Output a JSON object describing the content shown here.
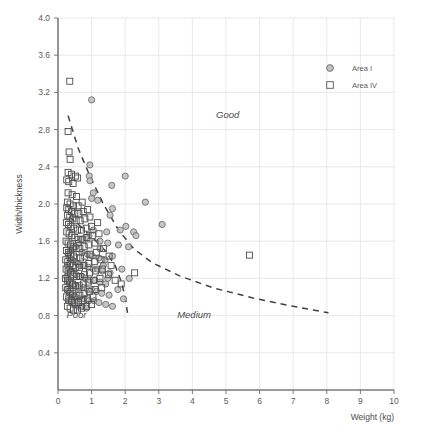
{
  "chart_data": {
    "type": "scatter",
    "title": "",
    "xlabel": "Weight (kg)",
    "ylabel": "Width/thickness",
    "xlim": [
      0,
      10
    ],
    "ylim": [
      0,
      4.0
    ],
    "xticks": [
      "0",
      "1",
      "2",
      "3",
      "4",
      "5",
      "6",
      "7",
      "8",
      "9",
      "10"
    ],
    "yticks": [
      "0.4",
      "0.8",
      "1.2",
      "1.6",
      "2.0",
      "2.4",
      "2.8",
      "3.2",
      "3.6",
      "4.0"
    ],
    "grid": true,
    "legend_position": "top-right",
    "legend": [
      {
        "name": "Area I",
        "marker": "circle",
        "fill": "#b8b8b8",
        "stroke": "#6b6b6b"
      },
      {
        "name": "Area IV",
        "marker": "square",
        "fill": "none",
        "stroke": "#555555"
      }
    ],
    "annotations": [
      {
        "text": "Good",
        "x": 5.05,
        "y": 2.93,
        "style": "italic"
      },
      {
        "text": "Medium",
        "x": 4.05,
        "y": 0.77,
        "style": "italic"
      },
      {
        "text": "Poor",
        "x": 0.55,
        "y": 0.77,
        "style": "italic"
      }
    ],
    "boundary_curves": [
      {
        "name": "good-medium-boundary",
        "style": "dashed",
        "points": [
          [
            0.3,
            2.95
          ],
          [
            0.6,
            2.6
          ],
          [
            0.95,
            2.3
          ],
          [
            1.35,
            2.0
          ],
          [
            1.8,
            1.72
          ],
          [
            2.25,
            1.52
          ],
          [
            2.8,
            1.37
          ],
          [
            3.6,
            1.23
          ],
          [
            4.6,
            1.1
          ],
          [
            5.8,
            0.99
          ],
          [
            7.0,
            0.9
          ],
          [
            8.05,
            0.83
          ]
        ]
      },
      {
        "name": "poor-medium-boundary",
        "style": "dashed",
        "points": [
          [
            0.35,
            1.86
          ],
          [
            0.7,
            1.75
          ],
          [
            1.05,
            1.63
          ],
          [
            1.4,
            1.5
          ],
          [
            1.7,
            1.34
          ],
          [
            1.9,
            1.15
          ],
          [
            2.02,
            0.95
          ],
          [
            2.08,
            0.8
          ]
        ]
      }
    ],
    "series": [
      {
        "name": "Area I",
        "marker": "circle",
        "points": [
          [
            1.0,
            3.12
          ],
          [
            0.95,
            2.42
          ],
          [
            0.93,
            2.3
          ],
          [
            0.95,
            2.25
          ],
          [
            2.0,
            2.3
          ],
          [
            1.6,
            2.2
          ],
          [
            1.05,
            2.12
          ],
          [
            1.0,
            2.06
          ],
          [
            1.18,
            2.04
          ],
          [
            2.6,
            2.02
          ],
          [
            1.62,
            1.95
          ],
          [
            1.55,
            1.88
          ],
          [
            3.1,
            1.78
          ],
          [
            2.02,
            1.76
          ],
          [
            1.85,
            1.72
          ],
          [
            2.25,
            1.7
          ],
          [
            1.45,
            1.7
          ],
          [
            2.32,
            1.66
          ],
          [
            1.05,
            1.72
          ],
          [
            0.92,
            1.66
          ],
          [
            0.82,
            1.64
          ],
          [
            0.7,
            1.62
          ],
          [
            1.25,
            1.6
          ],
          [
            1.48,
            1.58
          ],
          [
            1.8,
            1.56
          ],
          [
            2.1,
            1.54
          ],
          [
            0.6,
            1.58
          ],
          [
            0.52,
            1.54
          ],
          [
            0.45,
            1.52
          ],
          [
            0.38,
            1.5
          ],
          [
            0.72,
            1.48
          ],
          [
            0.88,
            1.46
          ],
          [
            1.02,
            1.44
          ],
          [
            1.22,
            1.42
          ],
          [
            1.4,
            1.4
          ],
          [
            1.62,
            1.44
          ],
          [
            0.3,
            1.46
          ],
          [
            0.35,
            1.42
          ],
          [
            0.42,
            1.4
          ],
          [
            0.5,
            1.38
          ],
          [
            0.58,
            1.36
          ],
          [
            0.65,
            1.34
          ],
          [
            0.78,
            1.34
          ],
          [
            0.9,
            1.32
          ],
          [
            1.05,
            1.3
          ],
          [
            1.18,
            1.3
          ],
          [
            1.32,
            1.28
          ],
          [
            1.55,
            1.26
          ],
          [
            0.28,
            1.34
          ],
          [
            0.33,
            1.3
          ],
          [
            0.4,
            1.28
          ],
          [
            0.48,
            1.26
          ],
          [
            0.55,
            1.24
          ],
          [
            0.62,
            1.22
          ],
          [
            0.72,
            1.22
          ],
          [
            0.82,
            1.2
          ],
          [
            0.95,
            1.18
          ],
          [
            1.1,
            1.18
          ],
          [
            1.25,
            1.16
          ],
          [
            1.42,
            1.14
          ],
          [
            0.26,
            1.22
          ],
          [
            0.31,
            1.18
          ],
          [
            0.38,
            1.16
          ],
          [
            0.45,
            1.14
          ],
          [
            0.53,
            1.12
          ],
          [
            0.62,
            1.1
          ],
          [
            0.75,
            1.1
          ],
          [
            0.88,
            1.08
          ],
          [
            1.0,
            1.08
          ],
          [
            1.15,
            1.06
          ],
          [
            1.3,
            1.04
          ],
          [
            1.52,
            1.02
          ],
          [
            0.27,
            1.08
          ],
          [
            0.34,
            1.04
          ],
          [
            0.42,
            1.02
          ],
          [
            0.52,
            1.0
          ],
          [
            0.64,
            0.98
          ],
          [
            0.78,
            0.98
          ],
          [
            0.92,
            0.96
          ],
          [
            1.08,
            0.96
          ],
          [
            1.22,
            0.94
          ],
          [
            1.78,
            1.08
          ],
          [
            1.42,
            0.92
          ],
          [
            1.62,
            0.9
          ],
          [
            0.3,
            0.96
          ],
          [
            0.4,
            0.94
          ],
          [
            0.5,
            0.92
          ],
          [
            0.6,
            0.9
          ],
          [
            0.72,
            0.9
          ],
          [
            0.85,
            0.88
          ],
          [
            1.25,
            1.52
          ],
          [
            1.35,
            1.34
          ],
          [
            1.48,
            1.2
          ],
          [
            1.9,
            1.3
          ],
          [
            2.12,
            1.2
          ],
          [
            1.95,
            0.98
          ]
        ]
      },
      {
        "name": "Area IV",
        "marker": "square",
        "points": [
          [
            0.35,
            3.32
          ],
          [
            0.3,
            2.78
          ],
          [
            0.33,
            2.56
          ],
          [
            0.36,
            2.48
          ],
          [
            0.3,
            2.34
          ],
          [
            0.4,
            2.32
          ],
          [
            0.52,
            2.3
          ],
          [
            0.26,
            2.26
          ],
          [
            0.32,
            2.24
          ],
          [
            0.45,
            2.22
          ],
          [
            0.58,
            2.28
          ],
          [
            0.3,
            2.12
          ],
          [
            0.42,
            2.1
          ],
          [
            0.55,
            2.08
          ],
          [
            0.28,
            2.02
          ],
          [
            0.36,
            2.0
          ],
          [
            0.46,
            1.98
          ],
          [
            0.6,
            1.98
          ],
          [
            0.72,
            2.02
          ],
          [
            0.26,
            1.96
          ],
          [
            0.32,
            1.94
          ],
          [
            0.4,
            1.92
          ],
          [
            0.5,
            1.9
          ],
          [
            0.62,
            1.9
          ],
          [
            0.75,
            1.92
          ],
          [
            0.88,
            1.94
          ],
          [
            0.28,
            1.88
          ],
          [
            0.35,
            1.86
          ],
          [
            0.44,
            1.84
          ],
          [
            0.54,
            1.82
          ],
          [
            0.66,
            1.82
          ],
          [
            0.8,
            1.84
          ],
          [
            0.95,
            1.86
          ],
          [
            0.25,
            1.8
          ],
          [
            0.31,
            1.78
          ],
          [
            0.38,
            1.76
          ],
          [
            0.47,
            1.74
          ],
          [
            0.58,
            1.72
          ],
          [
            0.7,
            1.72
          ],
          [
            0.84,
            1.74
          ],
          [
            1.0,
            1.76
          ],
          [
            1.18,
            1.8
          ],
          [
            0.26,
            1.7
          ],
          [
            0.33,
            1.68
          ],
          [
            0.41,
            1.66
          ],
          [
            0.5,
            1.64
          ],
          [
            0.6,
            1.62
          ],
          [
            0.72,
            1.62
          ],
          [
            0.86,
            1.64
          ],
          [
            1.02,
            1.66
          ],
          [
            1.22,
            1.68
          ],
          [
            0.24,
            1.6
          ],
          [
            0.3,
            1.58
          ],
          [
            0.37,
            1.56
          ],
          [
            0.45,
            1.54
          ],
          [
            0.54,
            1.52
          ],
          [
            0.65,
            1.52
          ],
          [
            0.78,
            1.54
          ],
          [
            0.92,
            1.56
          ],
          [
            1.1,
            1.58
          ],
          [
            0.25,
            1.5
          ],
          [
            0.31,
            1.48
          ],
          [
            0.38,
            1.46
          ],
          [
            0.46,
            1.44
          ],
          [
            0.56,
            1.42
          ],
          [
            0.67,
            1.42
          ],
          [
            0.8,
            1.44
          ],
          [
            0.95,
            1.46
          ],
          [
            1.14,
            1.48
          ],
          [
            1.35,
            1.52
          ],
          [
            0.23,
            1.4
          ],
          [
            0.29,
            1.38
          ],
          [
            0.36,
            1.36
          ],
          [
            0.44,
            1.34
          ],
          [
            0.53,
            1.32
          ],
          [
            0.64,
            1.32
          ],
          [
            0.77,
            1.34
          ],
          [
            0.92,
            1.36
          ],
          [
            1.08,
            1.38
          ],
          [
            1.28,
            1.4
          ],
          [
            1.52,
            1.44
          ],
          [
            0.24,
            1.3
          ],
          [
            0.3,
            1.28
          ],
          [
            0.37,
            1.26
          ],
          [
            0.45,
            1.24
          ],
          [
            0.55,
            1.22
          ],
          [
            0.66,
            1.22
          ],
          [
            0.79,
            1.24
          ],
          [
            0.94,
            1.26
          ],
          [
            1.12,
            1.28
          ],
          [
            1.32,
            1.3
          ],
          [
            1.58,
            1.34
          ],
          [
            0.22,
            1.2
          ],
          [
            0.28,
            1.18
          ],
          [
            0.35,
            1.16
          ],
          [
            0.43,
            1.14
          ],
          [
            0.52,
            1.12
          ],
          [
            0.63,
            1.12
          ],
          [
            0.76,
            1.14
          ],
          [
            0.9,
            1.16
          ],
          [
            1.06,
            1.18
          ],
          [
            1.25,
            1.2
          ],
          [
            1.5,
            1.24
          ],
          [
            2.28,
            1.26
          ],
          [
            0.23,
            1.1
          ],
          [
            0.29,
            1.08
          ],
          [
            0.36,
            1.06
          ],
          [
            0.44,
            1.04
          ],
          [
            0.54,
            1.02
          ],
          [
            0.65,
            1.02
          ],
          [
            0.78,
            1.04
          ],
          [
            0.93,
            1.06
          ],
          [
            1.1,
            1.08
          ],
          [
            1.3,
            1.1
          ],
          [
            0.25,
            1.0
          ],
          [
            0.32,
            0.98
          ],
          [
            0.4,
            0.96
          ],
          [
            0.5,
            0.94
          ],
          [
            0.61,
            0.94
          ],
          [
            0.74,
            0.96
          ],
          [
            0.88,
            0.98
          ],
          [
            1.04,
            1.0
          ],
          [
            0.28,
            0.9
          ],
          [
            0.36,
            0.88
          ],
          [
            0.46,
            0.86
          ],
          [
            0.58,
            0.86
          ],
          [
            0.7,
            0.88
          ],
          [
            0.84,
            0.9
          ],
          [
            1.0,
            0.92
          ],
          [
            5.7,
            1.45
          ],
          [
            1.7,
            1.18
          ],
          [
            1.88,
            1.14
          ]
        ]
      }
    ]
  }
}
